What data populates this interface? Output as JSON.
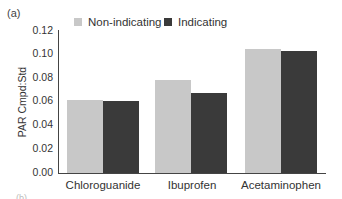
{
  "panel_label": "(a)",
  "next_panel_label": "(b)",
  "legend": [
    {
      "label": "Non-indicating",
      "color": "#c8c8c8"
    },
    {
      "label": "Indicating",
      "color": "#3a3a3a"
    }
  ],
  "yaxis": {
    "label": "PAR Cmpd:Std",
    "ticks": [
      "0.12",
      "0.10",
      "0.08",
      "0.06",
      "0.04",
      "0.02",
      "0.00"
    ]
  },
  "categories": [
    "Chloroguanide",
    "Ibuprofen",
    "Acetaminophen"
  ],
  "chart_data": {
    "type": "bar",
    "title": "",
    "xlabel": "",
    "ylabel": "PAR Cmpd:Std",
    "ylim": [
      0,
      0.12
    ],
    "yticks": [
      0.0,
      0.02,
      0.04,
      0.06,
      0.08,
      0.1,
      0.12
    ],
    "grid": false,
    "legend_position": "top",
    "categories": [
      "Chloroguanide",
      "Ibuprofen",
      "Acetaminophen"
    ],
    "series": [
      {
        "name": "Non-indicating",
        "color": "#c8c8c8",
        "values": [
          0.062,
          0.079,
          0.105
        ]
      },
      {
        "name": "Indicating",
        "color": "#3a3a3a",
        "values": [
          0.061,
          0.068,
          0.103
        ]
      }
    ]
  }
}
